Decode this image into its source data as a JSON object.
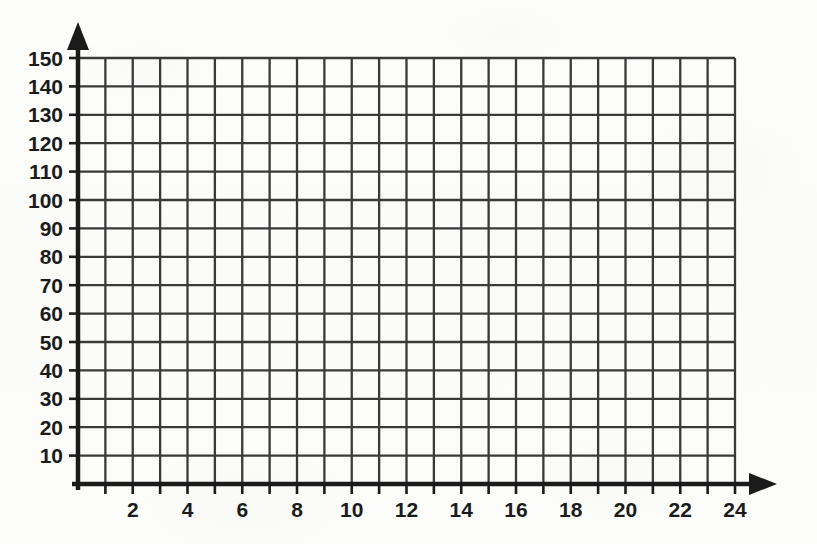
{
  "figure": {
    "kind": "blank-coordinate-grid",
    "background_color": "#fcfcfb",
    "grid_color": "#3a3a3a",
    "axis_color": "#1b1b1b",
    "label_color": "#1b1b1b"
  },
  "chart_data": {
    "type": "line",
    "title": "",
    "subtitle": "",
    "xlabel": "",
    "ylabel": "",
    "annotations": [],
    "legend": [],
    "legend_position": "none",
    "grid": true,
    "series": [],
    "x": [],
    "values": [],
    "xlim": [
      0,
      24
    ],
    "ylim": [
      0,
      150
    ],
    "x_tick_step": 1,
    "x_label_step": 2,
    "y_tick_step": 10,
    "y_label_step": 10,
    "x_ticks": [
      0,
      1,
      2,
      3,
      4,
      5,
      6,
      7,
      8,
      9,
      10,
      11,
      12,
      13,
      14,
      15,
      16,
      17,
      18,
      19,
      20,
      21,
      22,
      23,
      24
    ],
    "x_tick_labels": [
      "2",
      "4",
      "6",
      "8",
      "10",
      "12",
      "14",
      "16",
      "18",
      "20",
      "22",
      "24"
    ],
    "x_tick_label_values": [
      2,
      4,
      6,
      8,
      10,
      12,
      14,
      16,
      18,
      20,
      22,
      24
    ],
    "y_ticks": [
      10,
      20,
      30,
      40,
      50,
      60,
      70,
      80,
      90,
      100,
      110,
      120,
      130,
      140,
      150
    ],
    "y_tick_labels": [
      "10",
      "20",
      "30",
      "40",
      "50",
      "60",
      "70",
      "80",
      "90",
      "100",
      "110",
      "120",
      "130",
      "140",
      "150"
    ],
    "x_gridlines": [
      0,
      1,
      2,
      3,
      4,
      5,
      6,
      7,
      8,
      9,
      10,
      11,
      12,
      13,
      14,
      15,
      16,
      17,
      18,
      19,
      20,
      21,
      22,
      23,
      24
    ],
    "y_gridlines": [
      10,
      20,
      30,
      40,
      50,
      60,
      70,
      80,
      90,
      100,
      110,
      120,
      130,
      140,
      150
    ],
    "x_axis_arrow": true,
    "y_axis_arrow": true
  },
  "geometry": {
    "origin_x": 78,
    "origin_y": 484,
    "grid_right": 735,
    "grid_top": 58,
    "x_arrow_tip": 777,
    "y_arrow_tip": 22
  }
}
